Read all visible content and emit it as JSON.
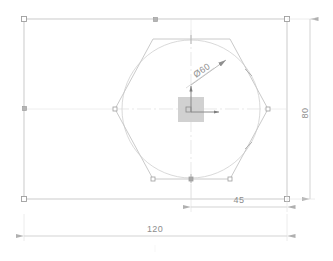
{
  "drawing": {
    "title": "Hexagon in rectangle CAD view",
    "background_color": "#ffffff",
    "geometry_color": "#b9b9b9",
    "dimension_color": "#c4c4c4",
    "text_color": "#8d8d8d",
    "grip_color": "#9e9e9e",
    "origin_marker_fill": "#c9c9c9"
  },
  "dimensions": [
    {
      "id": "width-overall",
      "label": "120",
      "orientation": "horizontal",
      "position": "bottom",
      "value": 120,
      "unit": "mm"
    },
    {
      "id": "offset-right",
      "label": "45",
      "orientation": "horizontal",
      "position": "bottom-right",
      "value": 45,
      "unit": "mm"
    },
    {
      "id": "height-overall",
      "label": "80",
      "orientation": "vertical",
      "position": "right",
      "value": 80,
      "unit": "mm"
    },
    {
      "id": "circle-diameter",
      "label": "Ø60",
      "orientation": "leader",
      "position": "upper-right-of-circle",
      "value": 60,
      "unit": "mm"
    }
  ],
  "entities": {
    "rectangle": {
      "name": "outer-rectangle",
      "width_label": "120",
      "height_label": "80"
    },
    "hexagon": {
      "name": "hexagon",
      "sides": 6
    },
    "circle": {
      "name": "inscribed-circle",
      "diameter_label": "Ø60"
    },
    "origin": {
      "name": "ucs-origin-marker",
      "axes": [
        "x",
        "y"
      ]
    }
  },
  "icons": {
    "grip_point": "grip-square-icon",
    "arrow_head": "dimension-arrow-icon",
    "origin_axis": "ucs-axis-icon"
  }
}
